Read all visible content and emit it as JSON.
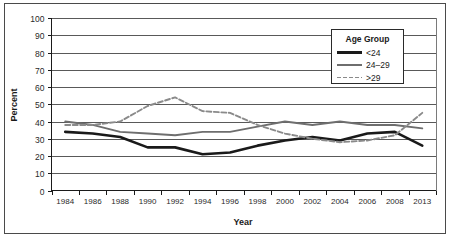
{
  "figure": {
    "frame_color": "#4a4a4a",
    "background": "#ffffff"
  },
  "chart_data": {
    "type": "line",
    "title": "",
    "xlabel": "Year",
    "ylabel": "Percent",
    "ylim": [
      0,
      100
    ],
    "ytick_step": 10,
    "yticks": [
      "0",
      "10",
      "20",
      "30",
      "40",
      "50",
      "60",
      "70",
      "80",
      "90",
      "100"
    ],
    "grid": "horizontal",
    "legend_position": "top-right",
    "legend_title": "Age Group",
    "categories": [
      "1984",
      "1986",
      "1988",
      "1990",
      "1992",
      "1994",
      "1996",
      "1998",
      "2000",
      "2002",
      "2004",
      "2006",
      "2008",
      "2013"
    ],
    "series": [
      {
        "name": "<24",
        "color": "#1a1a1a",
        "style": "solid",
        "width": 2.6,
        "values": [
          34,
          33,
          31,
          25,
          25,
          21,
          22,
          26,
          29,
          31,
          29,
          33,
          34,
          26
        ]
      },
      {
        "name": "24–29",
        "color": "#6e6e6e",
        "style": "solid",
        "width": 1.9,
        "values": [
          40,
          38,
          34,
          33,
          32,
          34,
          34,
          37,
          40,
          38,
          40,
          38,
          38,
          36
        ]
      },
      {
        "name": ">29",
        "color": "#8a8a8a",
        "style": "dashed",
        "width": 1.9,
        "values": [
          38,
          38,
          40,
          49,
          54,
          46,
          45,
          38,
          33,
          30,
          28,
          29,
          32,
          45
        ]
      }
    ]
  },
  "legend": {
    "title": "Age Group",
    "entries": [
      {
        "label": "<24"
      },
      {
        "label": "24–29"
      },
      {
        "label": ">29"
      }
    ]
  },
  "axes": {
    "x_title": "Year",
    "y_title": "Percent"
  }
}
